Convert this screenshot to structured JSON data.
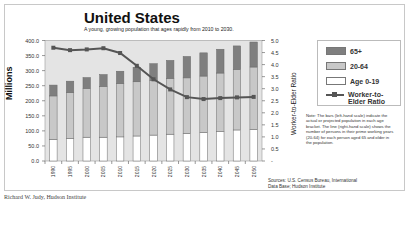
{
  "chart_data": {
    "type": "bar",
    "subtype": "stacked_bar_with_line",
    "title": "United States",
    "subtitle": "A young, growing population that ages rapidly from 2010 to 2030.",
    "xlabel": "",
    "ylabel": "Millions",
    "y2label": "Worker-to-Elder Ratio",
    "ylim": [
      0,
      400
    ],
    "y2lim": [
      0,
      5
    ],
    "yticks": [
      "0.0",
      "50.0",
      "100.0",
      "150.0",
      "200.0",
      "250.0",
      "300.0",
      "350.0",
      "400.0"
    ],
    "y2ticks": [
      "-",
      "0.5",
      "1.0",
      "1.5",
      "2.0",
      "2.5",
      "3.0",
      "3.5",
      "4.0",
      "4.5",
      "5.0"
    ],
    "grid": false,
    "legend_position": "right",
    "categories": [
      "1990",
      "1995",
      "2000",
      "2005",
      "2010",
      "2015",
      "2020",
      "2025",
      "2030",
      "2035",
      "2040",
      "2045",
      "2050"
    ],
    "series": [
      {
        "name": "Age 0-19",
        "type": "bar",
        "axis": "left",
        "color": "#ffffff",
        "values": [
          72,
          75,
          79,
          79,
          80,
          83,
          86,
          89,
          92,
          95,
          98,
          103,
          105
        ]
      },
      {
        "name": "20-64",
        "type": "bar",
        "axis": "left",
        "color": "#c8c8c8",
        "values": [
          144,
          152,
          162,
          169,
          177,
          180,
          181,
          185,
          184,
          187,
          194,
          201,
          207
        ]
      },
      {
        "name": "65+",
        "type": "bar",
        "axis": "left",
        "color": "#7f7f7f",
        "values": [
          36,
          38,
          36,
          39,
          41,
          48,
          56,
          60,
          71,
          77,
          79,
          78,
          83
        ]
      },
      {
        "name": "Worker-to-Elder Ratio",
        "type": "line",
        "axis": "right",
        "color": "#555555",
        "values": [
          4.7,
          4.6,
          4.63,
          4.68,
          4.48,
          3.95,
          3.39,
          2.97,
          2.65,
          2.57,
          2.61,
          2.64,
          2.66
        ]
      }
    ],
    "annotations": [
      "Note: The bars (left-hand scale) indicate the actual or projected population in each age bracket. The line (right-hand scale) shows the number of persons in their prime working years (20-64) for each person aged 65 and older in the population.",
      "Sources: U.S. Census Bureau, International Data Base; Hudson Institute"
    ]
  },
  "header": {
    "title": "United States",
    "subtitle": "A young, growing population that ages rapidly from 2010 to 2030."
  },
  "axes": {
    "left_label": "Millions",
    "right_label": "Worker-to-Elder Ratio"
  },
  "legend": {
    "items": [
      {
        "label": "65+",
        "color": "#7f7f7f"
      },
      {
        "label": "20-64",
        "color": "#c8c8c8"
      },
      {
        "label": "Age 0-19",
        "color": "#ffffff"
      },
      {
        "label": "Worker-to-Elder Ratio",
        "color": "#555555"
      }
    ]
  },
  "note": "Note: The bars (left-hand scale) indicate the actual or projected population in each age bracket. The line (right-hand scale) shows the number of persons in their prime working years (20-64) for each person aged 65 and older in the population.",
  "sources": {
    "line1": "Sources: U.S. Census Bureau, International",
    "line2": "Data Base; Hudson Institute"
  },
  "credit": "Richard W. Judy, Hudson Institute",
  "colors": {
    "plot_bg": "#e4e4e4",
    "bar_65": "#7f7f7f",
    "bar_2064": "#c8c8c8",
    "bar_019": "#ffffff",
    "line": "#555555"
  }
}
